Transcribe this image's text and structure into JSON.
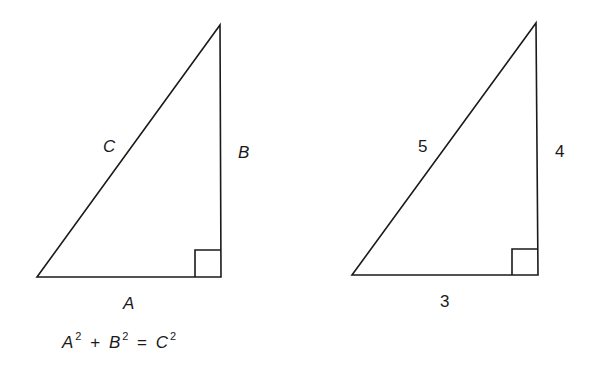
{
  "diagram": {
    "stroke_color": "#1a1a1a",
    "background": "#ffffff",
    "left_triangle": {
      "label_hypotenuse": "C",
      "label_vertical": "B",
      "label_base": "A",
      "vertices": {
        "bottom_left": [
          37,
          277
        ],
        "right_angle": [
          221,
          277
        ],
        "top": [
          220,
          25
        ]
      },
      "right_angle_marker": {
        "x": 195,
        "y": 250,
        "size": 26
      }
    },
    "right_triangle": {
      "label_hypotenuse": "5",
      "label_vertical": "4",
      "label_base": "3",
      "vertices": {
        "bottom_left": [
          352,
          275
        ],
        "right_angle": [
          538,
          275
        ],
        "top": [
          536,
          23
        ]
      },
      "right_angle_marker": {
        "x": 512,
        "y": 249,
        "size": 26
      }
    },
    "equation": {
      "term1": "A",
      "exp1": "2",
      "plus": "+",
      "term2": "B",
      "exp2": "2",
      "equals": "=",
      "term3": "C",
      "exp3": "2"
    }
  }
}
